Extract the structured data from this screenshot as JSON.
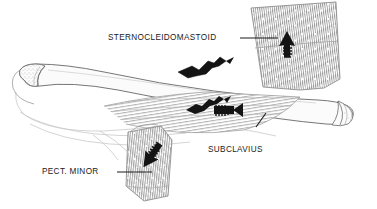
{
  "figure": {
    "background_color": "#ffffff",
    "ink_color": "#1a1a1a",
    "bone_fill": "#fbfbfb",
    "hatch_color": "#8d8d8d",
    "line_color": "#6f6f6f"
  },
  "labels": {
    "sternocleidomastoid": "STERNOCLEIDOMASTOID",
    "subclavius": "SUBCLAVIUS",
    "pect_minor": "PECT. MINOR"
  },
  "structures": {
    "clavicle": "clavicle-bone",
    "rib_cage": "rib-cage-contours",
    "sternocleidomastoid_muscle": "sternocleidomastoid-muscle-slab",
    "subclavius_muscle": "subclavius-muscle-band",
    "pect_minor_muscle": "pectoralis-minor-muscle-fan"
  },
  "markers": {
    "arrows": [
      {
        "name": "sternocleidomastoid-pull-arrow",
        "direction": "up"
      },
      {
        "name": "subclavius-pull-arrow",
        "direction": "right"
      },
      {
        "name": "pect-minor-pull-arrow",
        "direction": "down-left"
      }
    ],
    "torn_tissue": [
      {
        "name": "sternocleidomastoid-torn-attachment"
      },
      {
        "name": "subclavius-torn-attachment"
      }
    ]
  }
}
